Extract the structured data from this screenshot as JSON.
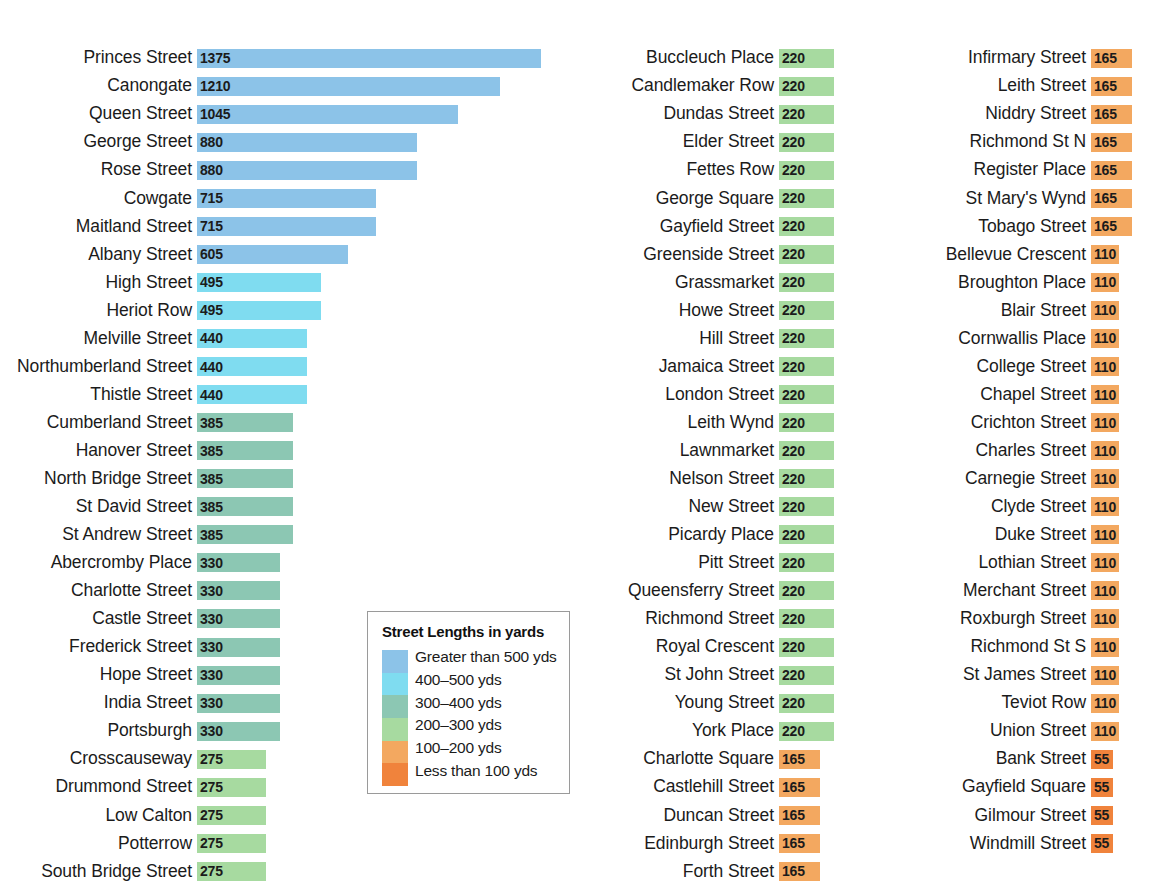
{
  "chart_data": {
    "type": "bar",
    "title": "Street Lengths in yards",
    "xlabel": "",
    "ylabel": "",
    "orientation": "horizontal",
    "units": "yards",
    "grid": false,
    "legend_position": "center-bottom-left",
    "xlim": [
      0,
      1375
    ],
    "px_per_yard": 0.25,
    "legend": {
      "title": "Street Lengths in yards",
      "entries": [
        {
          "label": "Greater than 500 yds",
          "color": "#8cc3e8"
        },
        {
          "label": "400–500 yds",
          "color": "#7fdcf0"
        },
        {
          "label": "300–400 yds",
          "color": "#8cc7b3"
        },
        {
          "label": "200–300 yds",
          "color": "#a7daa0"
        },
        {
          "label": "100–200 yds",
          "color": "#f3a860"
        },
        {
          "label": "Less than 100 yds",
          "color": "#f0833c"
        }
      ]
    },
    "colors": {
      "gt500": "#8cc3e8",
      "400_500": "#7fdcf0",
      "300_400": "#8cc7b3",
      "200_300": "#a7daa0",
      "100_200": "#f3a860",
      "lt100": "#f0833c"
    },
    "columns": [
      {
        "id": "column-1",
        "categories": [
          "Princes Street",
          "Canongate",
          "Queen Street",
          "George Street",
          "Rose Street",
          "Cowgate",
          "Maitland Street",
          "Albany Street",
          "High Street",
          "Heriot Row",
          "Melville Street",
          "Northumberland Street",
          "Thistle Street",
          "Cumberland Street",
          "Hanover Street",
          "North Bridge Street",
          "St David Street",
          "St Andrew Street",
          "Abercromby Place",
          "Charlotte Street",
          "Castle Street",
          "Frederick Street",
          "Hope Street",
          "India Street",
          "Portsburgh",
          "Crosscauseway",
          "Drummond Street",
          "Low Calton",
          "Potterrow",
          "South Bridge Street"
        ],
        "values": [
          1375,
          1210,
          1045,
          880,
          880,
          715,
          715,
          605,
          495,
          495,
          440,
          440,
          440,
          385,
          385,
          385,
          385,
          385,
          330,
          330,
          330,
          330,
          330,
          330,
          330,
          275,
          275,
          275,
          275,
          275
        ],
        "colors": [
          "#8cc3e8",
          "#8cc3e8",
          "#8cc3e8",
          "#8cc3e8",
          "#8cc3e8",
          "#8cc3e8",
          "#8cc3e8",
          "#8cc3e8",
          "#7fdcf0",
          "#7fdcf0",
          "#7fdcf0",
          "#7fdcf0",
          "#7fdcf0",
          "#8cc7b3",
          "#8cc7b3",
          "#8cc7b3",
          "#8cc7b3",
          "#8cc7b3",
          "#8cc7b3",
          "#8cc7b3",
          "#8cc7b3",
          "#8cc7b3",
          "#8cc7b3",
          "#8cc7b3",
          "#8cc7b3",
          "#a7daa0",
          "#a7daa0",
          "#a7daa0",
          "#a7daa0",
          "#a7daa0"
        ]
      },
      {
        "id": "column-2",
        "categories": [
          "Buccleuch Place",
          "Candlemaker Row",
          "Dundas Street",
          "Elder Street",
          "Fettes Row",
          "George Square",
          "Gayfield Street",
          "Greenside Street",
          "Grassmarket",
          "Howe Street",
          "Hill Street",
          "Jamaica Street",
          "London Street",
          "Leith Wynd",
          "Lawnmarket",
          "Nelson Street",
          "New Street",
          "Picardy Place",
          "Pitt Street",
          "Queensferry Street",
          "Richmond Street",
          "Royal Crescent",
          "St John Street",
          "Young Street",
          "York Place",
          "Charlotte Square",
          "Castlehill Street",
          "Duncan Street",
          "Edinburgh Street",
          "Forth Street"
        ],
        "values": [
          220,
          220,
          220,
          220,
          220,
          220,
          220,
          220,
          220,
          220,
          220,
          220,
          220,
          220,
          220,
          220,
          220,
          220,
          220,
          220,
          220,
          220,
          220,
          220,
          220,
          165,
          165,
          165,
          165,
          165
        ],
        "colors": [
          "#a7daa0",
          "#a7daa0",
          "#a7daa0",
          "#a7daa0",
          "#a7daa0",
          "#a7daa0",
          "#a7daa0",
          "#a7daa0",
          "#a7daa0",
          "#a7daa0",
          "#a7daa0",
          "#a7daa0",
          "#a7daa0",
          "#a7daa0",
          "#a7daa0",
          "#a7daa0",
          "#a7daa0",
          "#a7daa0",
          "#a7daa0",
          "#a7daa0",
          "#a7daa0",
          "#a7daa0",
          "#a7daa0",
          "#a7daa0",
          "#a7daa0",
          "#f3a860",
          "#f3a860",
          "#f3a860",
          "#f3a860",
          "#f3a860"
        ]
      },
      {
        "id": "column-3",
        "categories": [
          "Infirmary Street",
          "Leith Street",
          "Niddry Street",
          "Richmond St N",
          "Register Place",
          "St Mary's Wynd",
          "Tobago Street",
          "Bellevue Crescent",
          "Broughton Place",
          "Blair Street",
          "Cornwallis Place",
          "College Street",
          "Chapel Street",
          "Crichton Street",
          "Charles Street",
          "Carnegie Street",
          "Clyde Street",
          "Duke Street",
          "Lothian Street",
          "Merchant Street",
          "Roxburgh Street",
          "Richmond St S",
          "St James Street",
          "Teviot Row",
          "Union Street",
          "Bank Street",
          "Gayfield Square",
          "Gilmour Street",
          "Windmill Street"
        ],
        "values": [
          165,
          165,
          165,
          165,
          165,
          165,
          165,
          110,
          110,
          110,
          110,
          110,
          110,
          110,
          110,
          110,
          110,
          110,
          110,
          110,
          110,
          110,
          110,
          110,
          110,
          55,
          55,
          55,
          55
        ],
        "colors": [
          "#f3a860",
          "#f3a860",
          "#f3a860",
          "#f3a860",
          "#f3a860",
          "#f3a860",
          "#f3a860",
          "#f3a860",
          "#f3a860",
          "#f3a860",
          "#f3a860",
          "#f3a860",
          "#f3a860",
          "#f3a860",
          "#f3a860",
          "#f3a860",
          "#f3a860",
          "#f3a860",
          "#f3a860",
          "#f3a860",
          "#f3a860",
          "#f3a860",
          "#f3a860",
          "#f3a860",
          "#f3a860",
          "#f0833c",
          "#f0833c",
          "#f0833c",
          "#f0833c"
        ]
      }
    ]
  }
}
